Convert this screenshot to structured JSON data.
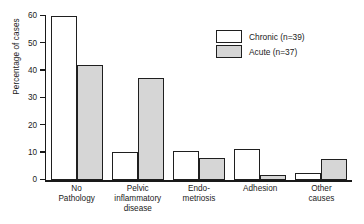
{
  "chart_data": {
    "type": "bar",
    "title": "",
    "xlabel": "",
    "ylabel": "Percentage of cases",
    "ylim": [
      0,
      60
    ],
    "yticks": [
      0,
      10,
      20,
      30,
      40,
      50,
      60
    ],
    "ytick_labels": [
      "0",
      "10",
      "20",
      "30",
      "40",
      "50",
      "60"
    ],
    "grid": false,
    "legend_position": "upper right",
    "categories": [
      "No\nPathology",
      "Pelvic\ninflammatory\ndisease",
      "Endo-\nmetriosis",
      "Adhesion",
      "Other\ncauses"
    ],
    "category_lines": [
      [
        "No",
        "Pathology"
      ],
      [
        "Pelvic",
        "inflammatory",
        "disease"
      ],
      [
        "Endo-",
        "metriosis"
      ],
      [
        "Adhesion"
      ],
      [
        "Other",
        "causes"
      ]
    ],
    "series": [
      {
        "name": "Chronic (n=39)",
        "short_name": "Chronic",
        "n": 39,
        "color": "#ffffff",
        "edge_color": "#1f1f1f",
        "values": [
          60,
          10.3,
          10.5,
          11.5,
          2.6
        ]
      },
      {
        "name": "Acute (n=37)",
        "short_name": "Acute",
        "n": 37,
        "color": "#d6d6d6",
        "edge_color": "#1f1f1f",
        "values": [
          42.2,
          37.5,
          8.2,
          2.0,
          7.6
        ]
      }
    ]
  },
  "legend": {
    "items": [
      {
        "label": "Chronic (n=39)",
        "swatch": "chronic"
      },
      {
        "label": "Acute (n=37)",
        "swatch": "acute"
      }
    ]
  }
}
